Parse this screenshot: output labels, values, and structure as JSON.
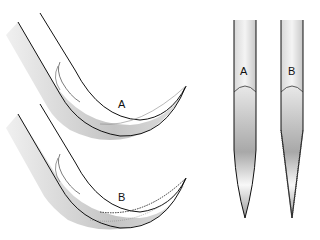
{
  "figure": {
    "curved_needles": [
      {
        "label": "A"
      },
      {
        "label": "B"
      }
    ],
    "straight_needles": [
      {
        "label": "A"
      },
      {
        "label": "B"
      }
    ]
  }
}
